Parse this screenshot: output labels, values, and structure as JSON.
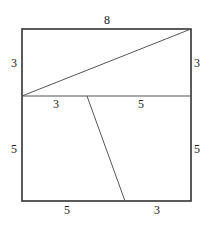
{
  "figure": {
    "stroke_color": "#333333",
    "outer_square": {
      "x1": 22,
      "y1": 29,
      "x2": 191,
      "y2": 201
    },
    "midline": {
      "x1": 22,
      "y1": 96,
      "x2": 191,
      "y2": 96
    },
    "diagonal": {
      "x1": 22,
      "y1": 96,
      "x2": 191,
      "y2": 29
    },
    "slant": {
      "x1": 87,
      "y1": 96,
      "x2": 125,
      "y2": 201
    },
    "labels": {
      "top": "8",
      "left_upper": "3",
      "right_upper": "3",
      "midline_left": "3",
      "midline_right": "5",
      "left_lower": "5",
      "right_lower": "5",
      "bottom_left": "5",
      "bottom_right": "3"
    }
  }
}
